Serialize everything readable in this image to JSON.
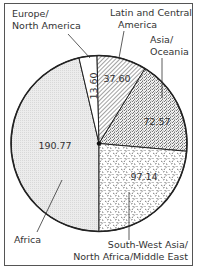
{
  "chart_data": {
    "type": "pie",
    "title": "",
    "categories": [
      "Europe/North America",
      "Latin and Central America",
      "Asia/Oceania",
      "South-West Asia/North Africa/Middle East",
      "Africa"
    ],
    "values": [
      13.6,
      37.6,
      72.57,
      97.14,
      190.77
    ],
    "value_labels": [
      "13.60",
      "37.60",
      "72.57",
      "97.14",
      "190.77"
    ],
    "label_lines": [
      [
        "Europe/",
        "North America"
      ],
      [
        "Latin and Central",
        "America"
      ],
      [
        "Asia/",
        "Oceania"
      ],
      [
        "South-West Asia/",
        "North Africa/Middle East"
      ],
      [
        "Africa"
      ]
    ],
    "fills": [
      "white",
      "diagonal-hatch",
      "cross-hatch",
      "random-dashes",
      "light-gray-dots"
    ],
    "legend": "none (callout labels)"
  },
  "colors": {
    "outline": "#222222",
    "frame": "#555555",
    "africa_fill": "#e6e6e6"
  }
}
